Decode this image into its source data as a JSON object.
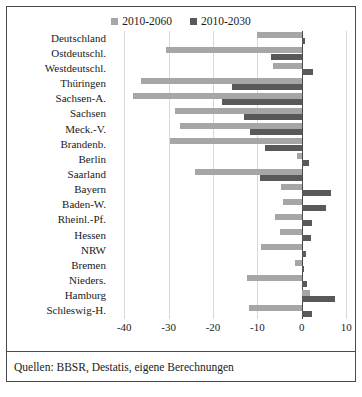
{
  "chart_data": {
    "type": "bar",
    "orientation": "horizontal",
    "title": "",
    "xlabel": "",
    "ylabel": "",
    "xlim": [
      -43,
      12
    ],
    "xticks": [
      -40,
      -30,
      -20,
      -10,
      0,
      10
    ],
    "xticklabels": [
      "-40",
      "-30",
      "-20",
      "-10",
      "0",
      "10"
    ],
    "grid": true,
    "legend_position": "top-center",
    "categories": [
      "Deutschland",
      "Ostdeutschl.",
      "Westdeutschl.",
      "Thüringen",
      "Sachsen-A.",
      "Sachsen",
      "Meck.-V.",
      "Brandenb.",
      "Berlin",
      "Saarland",
      "Bayern",
      "Baden-W.",
      "Rheinl.-Pf.",
      "Hessen",
      "NRW",
      "Bremen",
      "Nieders.",
      "Hamburg",
      "Schleswig-H."
    ],
    "series": [
      {
        "name": "2010-2060",
        "color": "#a6a6a6",
        "values": [
          -10.2,
          -30.6,
          -6.4,
          -36.2,
          -38.0,
          -28.6,
          -27.4,
          -29.8,
          -1.0,
          -24.0,
          -4.6,
          -4.2,
          -6.0,
          -5.0,
          -9.2,
          -1.6,
          -12.4,
          1.8,
          -12.0
        ]
      },
      {
        "name": "2010-2030",
        "color": "#595959",
        "values": [
          0.8,
          -7.0,
          2.6,
          -15.8,
          -18.0,
          -13.0,
          -11.6,
          -8.2,
          1.6,
          -9.4,
          6.6,
          5.4,
          2.4,
          2.0,
          1.0,
          0.6,
          1.2,
          7.4,
          2.4
        ]
      }
    ]
  },
  "legend": {
    "items": [
      {
        "label": "2010-2060",
        "color": "#a6a6a6"
      },
      {
        "label": "2010-2030",
        "color": "#595959"
      }
    ]
  },
  "caption": {
    "text": "Quellen: BBSR, Destatis, eigene Berechnungen"
  }
}
